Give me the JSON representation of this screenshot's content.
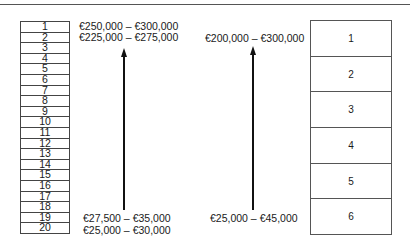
{
  "left_scale": {
    "rows": [
      "1",
      "2",
      "3",
      "4",
      "5",
      "6",
      "7",
      "8",
      "9",
      "10",
      "11",
      "12",
      "13",
      "14",
      "15",
      "16",
      "17",
      "18",
      "19",
      "20"
    ],
    "top_labels": [
      "€250,000 – €300,000",
      "€225,000 – €275,000"
    ],
    "bottom_labels": [
      "€27,500 – €35,000",
      "€25,000 – €30,000"
    ]
  },
  "right_scale": {
    "rows": [
      "1",
      "2",
      "3",
      "4",
      "5",
      "6"
    ],
    "top_label": "€200,000 – €300,000",
    "bottom_label": "€25,000 – €45,000"
  }
}
